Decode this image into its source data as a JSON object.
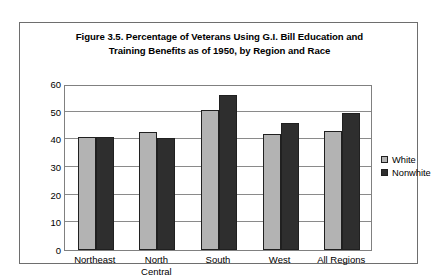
{
  "figure": {
    "title_line1": "Figure 3.5. Percentage of Veterans Using G.I. Bill Education and",
    "title_line2": "Training Benefits as of 1950, by Region and Race"
  },
  "axis": {
    "y_ticks": [
      "60",
      "50",
      "40",
      "30",
      "20",
      "10",
      "0"
    ]
  },
  "legend": {
    "items": [
      {
        "label": "White",
        "color": "#b3b3b3"
      },
      {
        "label": "Nonwhite",
        "color": "#2e2e2e"
      }
    ]
  },
  "categories_display": [
    {
      "line1": "Northeast",
      "line2": ""
    },
    {
      "line1": "North",
      "line2": "Central"
    },
    {
      "line1": "South",
      "line2": ""
    },
    {
      "line1": "West",
      "line2": ""
    },
    {
      "line1": "All Regions",
      "line2": ""
    }
  ],
  "chart_data": {
    "type": "bar",
    "title": "Figure 3.5. Percentage of Veterans Using G.I. Bill Education and Training Benefits as of 1950, by Region and Race",
    "xlabel": "",
    "ylabel": "",
    "ylim": [
      0,
      60
    ],
    "ytick_step": 10,
    "yticks": [
      0,
      10,
      20,
      30,
      40,
      50,
      60
    ],
    "grid": true,
    "legend_position": "right",
    "categories": [
      "Northeast",
      "North Central",
      "South",
      "West",
      "All Regions"
    ],
    "series": [
      {
        "name": "White",
        "color": "#b3b3b3",
        "values": [
          41,
          42.5,
          50.5,
          42,
          43
        ]
      },
      {
        "name": "Nonwhite",
        "color": "#2e2e2e",
        "values": [
          41,
          40.5,
          56,
          46,
          49.5
        ]
      }
    ]
  }
}
